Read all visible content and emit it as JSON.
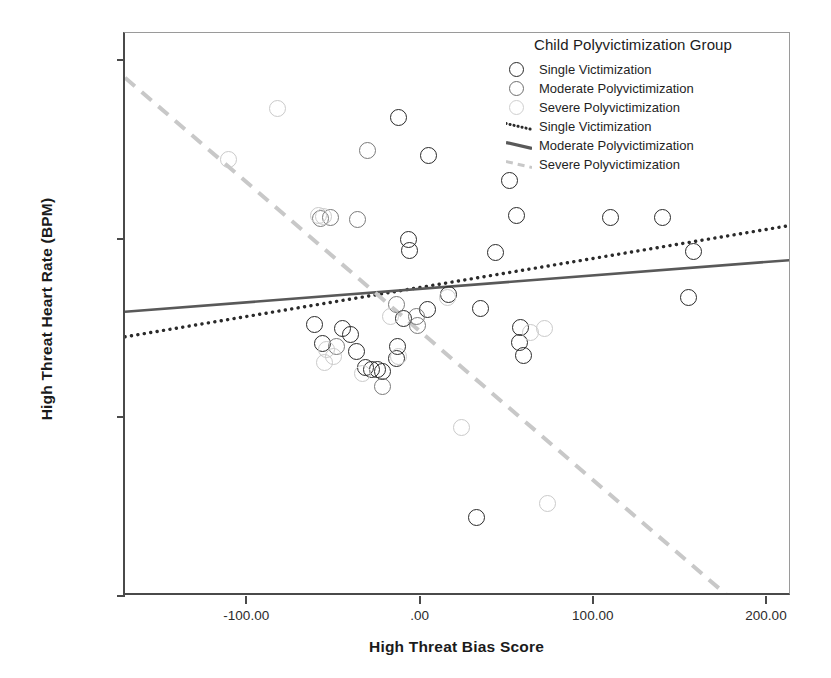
{
  "chart_data": {
    "type": "scatter",
    "title": "",
    "xlabel": "High Threat Bias Score",
    "ylabel": "High Threat Heart Rate (BPM)",
    "xlim": [
      -170,
      215
    ],
    "ylim": [
      40,
      103
    ],
    "xticks": [
      "-100.00",
      ".00",
      "100.00",
      "200.00"
    ],
    "xtick_values": [
      -100,
      0,
      100,
      200
    ],
    "yticks": [
      "40.00",
      "60.00",
      "80.00",
      "100.00"
    ],
    "ytick_values": [
      40,
      60,
      80,
      100
    ],
    "grid": false,
    "legend_position": "top-right",
    "legend_title": "Child Polyvictimization Group",
    "series": [
      {
        "name": "Single Victimization",
        "color": "#2a2a2a",
        "marker": "open-circle",
        "points": [
          [
            -60.5,
            70.4
          ],
          [
            -56.0,
            68.2
          ],
          [
            -44.5,
            69.9
          ],
          [
            -40.0,
            69.3
          ],
          [
            -36.5,
            67.4
          ],
          [
            -31.0,
            65.6
          ],
          [
            -27.5,
            65.4
          ],
          [
            -24.5,
            65.3
          ],
          [
            -21.5,
            65.1
          ],
          [
            -13.5,
            66.6
          ],
          [
            -12.0,
            93.6
          ],
          [
            -12.5,
            67.9
          ],
          [
            -9.0,
            71.1
          ],
          [
            -6.5,
            79.9
          ],
          [
            -6.0,
            78.7
          ],
          [
            5.0,
            89.3
          ],
          [
            4.5,
            72.1
          ],
          [
            17.0,
            73.7
          ],
          [
            33.0,
            48.8
          ],
          [
            35.0,
            72.2
          ],
          [
            44.0,
            78.4
          ],
          [
            52.0,
            86.5
          ],
          [
            56.0,
            82.6
          ],
          [
            58.0,
            70.1
          ],
          [
            57.5,
            68.4
          ],
          [
            60.0,
            66.9
          ],
          [
            110.0,
            82.4
          ],
          [
            140.0,
            82.3
          ],
          [
            155.0,
            73.4
          ],
          [
            158.0,
            78.5
          ]
        ]
      },
      {
        "name": "Moderate Polyvictimization",
        "color": "#7a7a7a",
        "marker": "open-circle",
        "points": [
          [
            -57.0,
            82.2
          ],
          [
            -51.5,
            82.3
          ],
          [
            -36.0,
            82.1
          ],
          [
            -30.0,
            89.8
          ],
          [
            -17.0,
            106.6
          ],
          [
            -13.0,
            72.6
          ],
          [
            -1.0,
            70.3
          ],
          [
            -2.0,
            71.3
          ],
          [
            -21.5,
            63.4
          ],
          [
            -48.0,
            67.9
          ]
        ]
      },
      {
        "name": "Severe Polyvictimization",
        "color": "#cacaca",
        "marker": "open-circle",
        "points": [
          [
            -110.0,
            88.9
          ],
          [
            -82.0,
            94.5
          ],
          [
            -58.5,
            82.6
          ],
          [
            -55.5,
            82.5
          ],
          [
            -55.0,
            66.1
          ],
          [
            -53.5,
            67.6
          ],
          [
            -49.5,
            66.8
          ],
          [
            -33.0,
            64.9
          ],
          [
            -16.5,
            71.3
          ],
          [
            -12.0,
            66.8
          ],
          [
            16.0,
            73.4
          ],
          [
            24.0,
            58.9
          ],
          [
            72.0,
            69.9
          ],
          [
            74.0,
            50.4
          ],
          [
            64.0,
            69.5
          ]
        ]
      }
    ],
    "fit_lines": [
      {
        "name": "Single Victimization",
        "style": "dotted",
        "color": "#2a2a2a",
        "x0": -170,
        "y0": 69.0,
        "x1": 215,
        "y1": 81.5
      },
      {
        "name": "Moderate Polyvictimization",
        "style": "solid",
        "color": "#595959",
        "x0": -170,
        "y0": 71.8,
        "x1": 215,
        "y1": 77.6
      },
      {
        "name": "Severe Polyvictimization",
        "style": "dashed",
        "color": "#c8c8c8",
        "x0": -170,
        "y0": 98.0,
        "x1": 178,
        "y1": 40.0
      }
    ]
  },
  "legend": {
    "title": "Child Polyvictimization Group",
    "marker_entries": [
      {
        "label": "Single Victimization",
        "key": "circle-single"
      },
      {
        "label": "Moderate Polyvictimization",
        "key": "circle-moderate"
      },
      {
        "label": "Severe Polyvictimization",
        "key": "circle-severe"
      }
    ],
    "line_entries": [
      {
        "label": "Single Victimization",
        "key": "line-dotted"
      },
      {
        "label": "Moderate Polyvictimization",
        "key": "line-solid"
      },
      {
        "label": "Severe Polyvictimization",
        "key": "line-dashed"
      }
    ]
  }
}
